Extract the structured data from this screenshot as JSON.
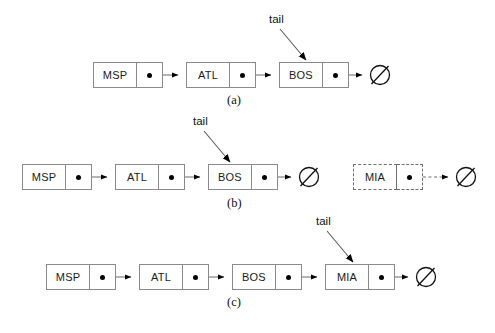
{
  "figure": {
    "null_symbol": "∅",
    "pointer_dot": "•"
  },
  "style": {
    "background": "#ffffff",
    "border_color": "#8a8a8a",
    "dashed_border_color": "#6f6f6f",
    "line_color": "#6b6b6b",
    "arrowhead_color": "#000000",
    "text_color": "#1a1a1a"
  },
  "panels": [
    {
      "id": "a",
      "caption": "(a)",
      "tail_label": "tail",
      "tail_points_to": "BOS",
      "nodes": [
        {
          "label": "MSP",
          "pointer": "•",
          "dashed": false
        },
        {
          "label": "ATL",
          "pointer": "•",
          "dashed": false
        },
        {
          "label": "BOS",
          "pointer": "•",
          "dashed": false
        }
      ],
      "terminator": "∅",
      "detached": null
    },
    {
      "id": "b",
      "caption": "(b)",
      "tail_label": "tail",
      "tail_points_to": "BOS",
      "nodes": [
        {
          "label": "MSP",
          "pointer": "•",
          "dashed": false
        },
        {
          "label": "ATL",
          "pointer": "•",
          "dashed": false
        },
        {
          "label": "BOS",
          "pointer": "•",
          "dashed": false
        }
      ],
      "terminator": "∅",
      "detached": {
        "label": "MIA",
        "pointer": "•",
        "dashed": true,
        "terminator": "∅"
      }
    },
    {
      "id": "c",
      "caption": "(c)",
      "tail_label": "tail",
      "tail_points_to": "MIA",
      "nodes": [
        {
          "label": "MSP",
          "pointer": "•",
          "dashed": false
        },
        {
          "label": "ATL",
          "pointer": "•",
          "dashed": false
        },
        {
          "label": "BOS",
          "pointer": "•",
          "dashed": false
        },
        {
          "label": "MIA",
          "pointer": "•",
          "dashed": false
        }
      ],
      "terminator": "∅",
      "detached": null
    }
  ]
}
